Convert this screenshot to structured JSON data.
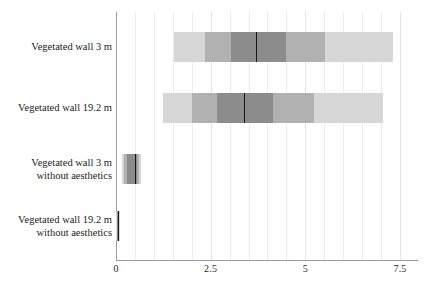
{
  "chart_data": {
    "type": "bar",
    "title": "",
    "xlabel": "",
    "ylabel": "",
    "orientation": "horizontal",
    "grid": true,
    "legend": "none",
    "xlim": [
      0,
      7.9
    ],
    "xticks": [
      {
        "value": 0,
        "label": "0"
      },
      {
        "value": 2.5,
        "label": "2.5"
      },
      {
        "value": 5,
        "label": "5"
      },
      {
        "value": 7.5,
        "label": "7.5"
      }
    ],
    "minor_grid_step": 0.5,
    "categories": [
      "Vegetated wall 3 m",
      "Vegetated wall 19.2 m",
      "Vegetated wall 3 m\nwithout aesthetics",
      "Vegetated wall 19.2 m\nwithout aesthetics"
    ],
    "band_colors": {
      "outer": "#d7d7d7",
      "mid": "#b1b1b1",
      "inner": "#8c8c8c",
      "median": "#171717"
    },
    "series": [
      {
        "name": "Vegetated wall 3 m",
        "median": 3.69,
        "bands": [
          {
            "level": "outer",
            "lo": 1.52,
            "hi": 7.32
          },
          {
            "level": "mid",
            "lo": 2.34,
            "hi": 5.52
          },
          {
            "level": "inner",
            "lo": 3.03,
            "hi": 4.48
          }
        ]
      },
      {
        "name": "Vegetated wall 19.2 m",
        "median": 3.37,
        "bands": [
          {
            "level": "outer",
            "lo": 1.23,
            "hi": 7.05
          },
          {
            "level": "mid",
            "lo": 2.0,
            "hi": 5.23
          },
          {
            "level": "inner",
            "lo": 2.68,
            "hi": 4.15
          }
        ]
      },
      {
        "name": "Vegetated wall 3 m without aesthetics",
        "median": 0.49,
        "bands": [
          {
            "level": "outer",
            "lo": 0.16,
            "hi": 0.66
          },
          {
            "level": "mid",
            "lo": 0.22,
            "hi": 0.62
          },
          {
            "level": "inner",
            "lo": 0.3,
            "hi": 0.56
          }
        ]
      },
      {
        "name": "Vegetated wall 19.2 m without aesthetics",
        "median": 0.05,
        "bands": [
          {
            "level": "outer",
            "lo": 0.01,
            "hi": 0.1
          },
          {
            "level": "mid",
            "lo": 0.02,
            "hi": 0.09
          },
          {
            "level": "inner",
            "lo": 0.03,
            "hi": 0.08
          }
        ]
      }
    ]
  }
}
